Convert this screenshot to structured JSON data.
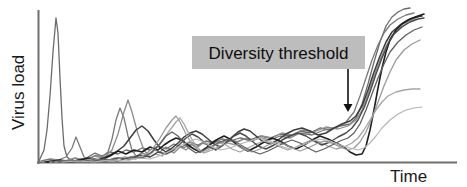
{
  "chart_data": {
    "type": "line",
    "title": "",
    "xlabel": "Time",
    "ylabel": "Virus load",
    "xlim": [
      0,
      100
    ],
    "ylim": [
      0,
      100
    ],
    "grid": false,
    "legend": false,
    "axis_ticks": false,
    "annotations": [
      {
        "id": "diversity-threshold",
        "text": "Diversity threshold",
        "box_color": "#bdbdbd",
        "text_color": "#0d0d0d",
        "box_x": 192,
        "box_y": 36,
        "box_w": 173,
        "box_h": 33,
        "arrow_x": 348,
        "arrow_y_start": 69,
        "arrow_y_end": 112,
        "arrow_color": "#111111"
      }
    ],
    "colors": {
      "axis": "#6e6e6e",
      "text": "#1a1a1a",
      "curve_dark": "#2f2f2f",
      "curve_mid": "#5a5a5a",
      "curve_light": "#a8a8a8"
    },
    "series": [
      {
        "name": "patient-1",
        "color": "#6b6b6b",
        "width": 1.3,
        "points": "39,161 44,150 47,130 50,96 53,52 56,18 58,33 60,78 62,118 64,146 67,157 71,160 76,158 81,160 88,157 95,153 102,156 110,152 118,154 126,150 134,152 142,148 150,150 158,146 166,149 174,144 182,147 190,142 198,145 206,141 214,143 222,139 230,141 240,138 250,140 260,136 270,138 280,134 290,136 300,131 310,133 320,128 330,130 340,126 350,124 356,118 362,104 368,84 374,62 380,42 386,26 392,17 398,12 404,9 410,8"
      },
      {
        "name": "patient-2",
        "color": "#7a7a7a",
        "width": 1.3,
        "points": "41,161 50,159 58,160 66,157 72,148 76,137 80,147 84,157 90,159 96,155 102,157 108,152 112,139 116,120 120,108 124,118 128,136 132,150 136,156 142,153 148,155 154,150 160,152 166,147 172,150 178,146 184,148 190,144 196,147 202,143 208,145 214,141 220,143 228,140 236,142 244,139 252,141 260,138 270,140 280,136 290,138 300,133 312,135 324,130 336,128 346,122 354,112 360,96 366,78 372,60 378,45 384,33 390,25 398,19 406,15 414,13"
      },
      {
        "name": "patient-3",
        "color": "#8c8c8c",
        "width": 1.3,
        "points": "43,162 54,160 64,161 74,158 84,160 94,156 104,158 112,150 118,134 124,112 128,100 132,112 138,134 144,150 150,157 156,154 162,156 168,150 174,153 180,147 186,150 192,144 198,147 204,142 210,145 216,140 222,143 230,139 238,142 246,138 254,140 262,136 272,138 282,133 292,135 302,130 314,132 326,127 338,129 348,126 356,120 362,110 368,94 374,76 380,60 386,46 392,36 400,28 408,22 416,18 422,15"
      },
      {
        "name": "patient-4",
        "color": "#3d3d3d",
        "width": 1.5,
        "points": "45,162 58,161 70,162 82,159 94,161 106,157 116,152 124,146 130,138 136,130 142,126 148,131 154,140 160,148 166,152 172,148 178,143 184,137 190,133 196,131 202,134 208,139 214,144 220,147 226,143 232,137 238,132 244,129 250,131 256,136 262,141 270,144 278,140 286,134 294,130 302,128 310,131 318,135 326,133 334,128 342,124 350,121 356,116 362,106 368,90 374,72 380,56 386,42 392,32 400,25 408,20 416,17 422,16"
      },
      {
        "name": "patient-5",
        "color": "#1f1f1f",
        "width": 1.6,
        "points": "47,162 60,160 74,162 88,158 100,160 110,156 118,151 126,154 134,150 142,152 150,147 158,150 164,145 170,141 176,138 182,140 188,145 194,149 200,152 206,148 212,143 218,139 224,136 230,139 236,144 242,148 248,151 256,147 264,142 272,138 280,141 288,146 296,149 304,145 312,140 320,136 328,139 336,143 344,147 350,152 356,155 362,154 366,146 370,130 374,110 378,88 382,68 386,52 390,40 396,30 402,24 410,19 418,16 424,14"
      },
      {
        "name": "patient-6",
        "color": "#a5a5a5",
        "width": 1.3,
        "points": "50,162 64,161 78,162 92,159 104,161 114,158 124,159 134,156 144,158 152,153 158,146 164,138 170,130 176,122 180,118 184,124 190,136 196,146 202,152 208,150 214,146 220,143 226,145 232,149 240,152 248,148 256,144 264,141 272,143 280,147 288,150 296,147 304,143 312,140 320,142 328,146 336,149 344,147 352,143 358,138 364,130 370,120 376,110 382,102 388,96 396,92 404,90 412,89 420,89"
      },
      {
        "name": "patient-7",
        "color": "#4a4a4a",
        "width": 1.4,
        "points": "52,162 66,161 80,162 94,160 106,161 118,158 130,159 140,155 150,157 158,152 166,154 174,150 180,144 186,138 192,134 198,137 204,142 210,147 216,150 222,146 228,141 234,136 240,133 246,136 252,141 258,146 266,149 274,145 282,140 290,136 298,133 306,136 314,141 322,145 330,142 338,137 346,133 352,128 358,120 364,108 370,92 376,74 382,58 388,44 394,34 402,27 410,22 418,19 424,18"
      },
      {
        "name": "patient-8",
        "color": "#9a9a9a",
        "width": 1.3,
        "points": "55,162 70,161 84,162 98,160 112,161 124,157 136,159 146,154 154,147 160,138 166,128 172,120 176,116 180,122 186,134 192,144 198,150 204,153 212,150 220,146 228,143 236,145 244,149 252,152 260,149 268,145 276,142 284,144 292,148 300,151 308,148 316,144 324,141 332,143 340,147 348,150 354,148 360,142 366,132 372,118 378,102 384,86 390,72 396,60 404,50 412,44 420,40"
      },
      {
        "name": "patient-9",
        "color": "#5f5f5f",
        "width": 1.3,
        "points": "58,162 74,161 90,162 104,159 118,161 130,157 142,158 152,152 160,144 166,136 172,132 178,136 184,143 190,149 196,153 204,150 212,146 220,142 228,139 236,142 244,147 252,151 260,154 268,151 276,147 284,143 292,140 300,143 308,148 316,152 324,149 332,145 340,141 348,138 354,133 360,124 366,110 372,94 378,78 384,64 390,52 398,42 406,35 414,30 422,27"
      },
      {
        "name": "patient-10",
        "color": "#b5b5b5",
        "width": 1.2,
        "points": "62,162 78,161 94,162 110,160 126,161 138,158 150,159 162,155 172,150 180,146 188,142 196,139 204,142 212,147 220,150 230,148 240,144 250,141 260,138 270,141 280,146 290,149 300,146 310,142 320,139 330,141 340,145 350,148 358,150 364,148 370,143 376,136 382,128 390,120 398,114 406,110 414,108 422,107"
      }
    ]
  },
  "labels": {
    "y_axis": "Virus load",
    "x_axis": "Time"
  }
}
